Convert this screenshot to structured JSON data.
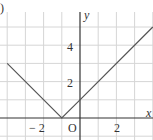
{
  "panel_label": ")",
  "chart_data": {
    "type": "line",
    "title": "",
    "function": "y = |x + 1|",
    "xlabel": "x",
    "ylabel": "y",
    "origin_label": "O",
    "x_ticks": [
      {
        "value": -2,
        "label": "− 2"
      },
      {
        "value": 2,
        "label": "2"
      }
    ],
    "y_ticks": [
      {
        "value": 2,
        "label": "2"
      },
      {
        "value": 4,
        "label": "4"
      }
    ],
    "xlim": [
      -4.2,
      4
    ],
    "ylim": [
      -1,
      6
    ],
    "grid": true,
    "series": [
      {
        "name": "y = |x + 1|",
        "points": [
          [
            -4,
            3
          ],
          [
            -1,
            0
          ],
          [
            0,
            1
          ],
          [
            4,
            5
          ]
        ]
      }
    ]
  },
  "colors": {
    "grid": "#d6d6d6",
    "axis": "#333333",
    "line": "#555555"
  }
}
